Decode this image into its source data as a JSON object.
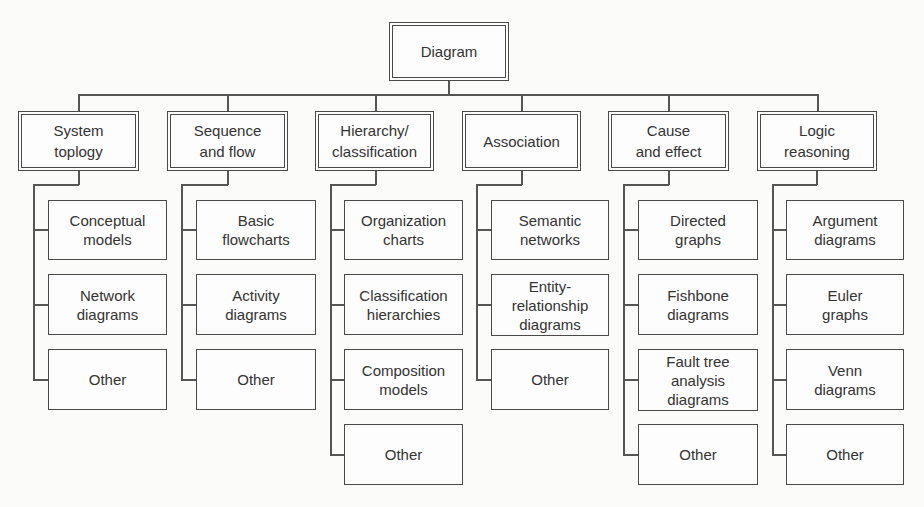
{
  "root": {
    "label": "Diagram"
  },
  "categories": [
    {
      "label": "System\ntoplogy",
      "children": [
        "Conceptual\nmodels",
        "Network\ndiagrams",
        "Other"
      ]
    },
    {
      "label": "Sequence\nand flow",
      "children": [
        "Basic\nflowcharts",
        "Activity\ndiagrams",
        "Other"
      ]
    },
    {
      "label": "Hierarchy/\nclassification",
      "children": [
        "Organization\ncharts",
        "Classification\nhierarchies",
        "Composition\nmodels",
        "Other"
      ]
    },
    {
      "label": "Association",
      "children": [
        "Semantic\nnetworks",
        "Entity-\nrelationship\ndiagrams",
        "Other"
      ]
    },
    {
      "label": "Cause\nand effect",
      "children": [
        "Directed\ngraphs",
        "Fishbone\ndiagrams",
        "Fault tree\nanalysis\ndiagrams",
        "Other"
      ]
    },
    {
      "label": "Logic\nreasoning",
      "children": [
        "Argument\ndiagrams",
        "Euler\ngraphs",
        "Venn\ndiagrams",
        "Other"
      ]
    }
  ],
  "colors": {
    "line": "#555555",
    "border": "#4a4a4a",
    "text": "#333333",
    "background": "#fbfbfa"
  }
}
